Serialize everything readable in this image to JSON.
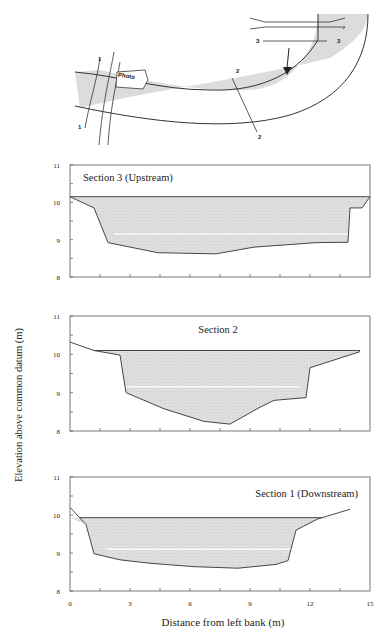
{
  "figure": {
    "ylabel": "Elevation above common datum (m)",
    "xlabel": "Distance from left bank (m)",
    "colors": {
      "water": "#dcdcdc",
      "line": "#333333",
      "white_band": "#ffffff"
    }
  },
  "plan_view": {
    "photo_label": "Photo",
    "section_labels": [
      "1",
      "1",
      "2",
      "2",
      "3",
      "3"
    ],
    "flow_arrow": "arrow-down"
  },
  "chart_data": [
    {
      "type": "area",
      "title": "Section 3 (Upstream)",
      "xlabel": "",
      "ylabel": "Elevation above common datum (m)",
      "xlim": [
        0,
        15
      ],
      "ylim": [
        8,
        11
      ],
      "yticks": [
        "8",
        "9",
        "10",
        "11"
      ],
      "water_surface": 10.15,
      "bed_profile": {
        "x": [
          0,
          1.2,
          1.9,
          4.4,
          7.3,
          9.2,
          12.3,
          13.9,
          14.0,
          14.6,
          15.0
        ],
        "y": [
          10.15,
          9.85,
          8.92,
          8.65,
          8.62,
          8.8,
          8.92,
          8.93,
          9.85,
          9.85,
          10.15
        ]
      },
      "white_band_elev": 9.15
    },
    {
      "type": "area",
      "title": "Section 2",
      "xlabel": "",
      "ylabel": "Elevation above common datum (m)",
      "xlim": [
        0,
        15
      ],
      "ylim": [
        8,
        11
      ],
      "yticks": [
        "8",
        "9",
        "10",
        "11"
      ],
      "water_surface": 10.1,
      "bed_profile": {
        "x": [
          0,
          1.2,
          2.5,
          2.8,
          4.7,
          6.7,
          8.0,
          9.5,
          10.2,
          11.8,
          12.0,
          14.5
        ],
        "y": [
          10.32,
          10.1,
          9.98,
          9.0,
          8.58,
          8.25,
          8.18,
          8.62,
          8.8,
          8.87,
          9.65,
          10.07
        ]
      },
      "white_band_elev": 9.15
    },
    {
      "type": "area",
      "title": "Section 1 (Downstream)",
      "xlabel": "Distance from left bank (m)",
      "ylabel": "Elevation above common datum (m)",
      "xlim": [
        0,
        15
      ],
      "ylim": [
        8,
        11
      ],
      "xticks": [
        "0",
        "3",
        "6",
        "9",
        "12",
        "15"
      ],
      "yticks": [
        "8",
        "9",
        "10",
        "11"
      ],
      "water_surface": 9.93,
      "bed_profile": {
        "x": [
          0,
          0.8,
          1.2,
          2.5,
          4.0,
          6.2,
          8.4,
          10.3,
          10.9,
          11.3,
          12.4,
          14.0
        ],
        "y": [
          10.2,
          9.75,
          8.98,
          8.82,
          8.73,
          8.64,
          8.6,
          8.7,
          8.8,
          9.6,
          9.9,
          10.15
        ]
      },
      "white_band_elev": 9.1
    }
  ]
}
